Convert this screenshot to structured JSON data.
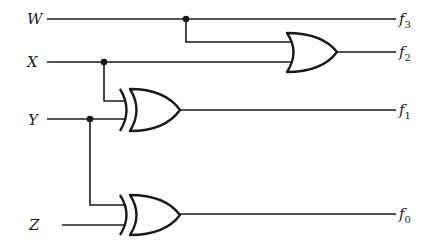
{
  "diagram": {
    "type": "logic-circuit",
    "inputs": [
      {
        "id": "W",
        "label": "W"
      },
      {
        "id": "X",
        "label": "X"
      },
      {
        "id": "Y",
        "label": "Y"
      },
      {
        "id": "Z",
        "label": "Z"
      }
    ],
    "outputs": [
      {
        "id": "f3",
        "label": "f",
        "subscript": "3",
        "expression": "W"
      },
      {
        "id": "f2",
        "label": "f",
        "subscript": "2",
        "expression": "W OR X"
      },
      {
        "id": "f1",
        "label": "f",
        "subscript": "1",
        "expression": "X XOR Y"
      },
      {
        "id": "f0",
        "label": "f",
        "subscript": "0",
        "expression": "Y XOR Z"
      }
    ],
    "gates": [
      {
        "id": "g_or",
        "type": "OR",
        "inputs": [
          "W",
          "X"
        ],
        "output": "f2"
      },
      {
        "id": "g_xor1",
        "type": "XOR",
        "inputs": [
          "X",
          "Y"
        ],
        "output": "f1"
      },
      {
        "id": "g_xor2",
        "type": "XOR",
        "inputs": [
          "Y",
          "Z"
        ],
        "output": "f0"
      }
    ],
    "colors": {
      "ink": "#1a1a1a",
      "background": "#ffffff"
    }
  }
}
